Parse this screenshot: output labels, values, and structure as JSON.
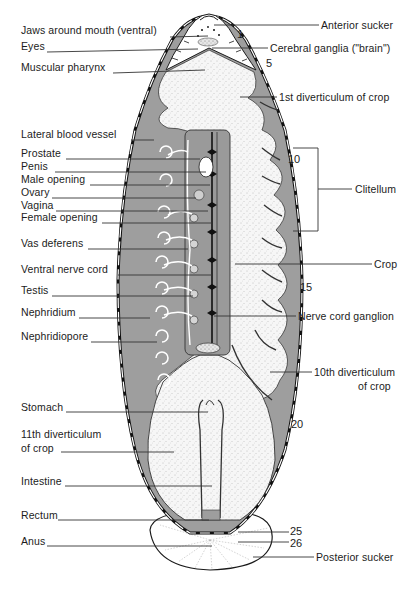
{
  "figure": {
    "colors": {
      "ink": "#1a1a1a",
      "gray_tissue": "#9a9a9a",
      "stipple_light": "#f2f2f2",
      "background": "#ffffff"
    }
  },
  "labels_left": [
    {
      "text": "Jaws around mouth (ventral)",
      "x": 21,
      "y": 30
    },
    {
      "text": "Eyes",
      "x": 21,
      "y": 46
    },
    {
      "text": "Muscular  pharynx",
      "x": 21,
      "y": 67
    },
    {
      "text": "Lateral  blood  vessel",
      "x": 21,
      "y": 134
    },
    {
      "text": "Prostate",
      "x": 21,
      "y": 153
    },
    {
      "text": "Penis",
      "x": 21,
      "y": 166
    },
    {
      "text": "Male opening",
      "x": 21,
      "y": 179
    },
    {
      "text": "Ovary",
      "x": 21,
      "y": 192
    },
    {
      "text": "Vagina",
      "x": 21,
      "y": 205
    },
    {
      "text": "Female opening",
      "x": 21,
      "y": 217
    },
    {
      "text": "Vas deferens",
      "x": 21,
      "y": 243
    },
    {
      "text": "Ventral  nerve  cord",
      "x": 21,
      "y": 269
    },
    {
      "text": "Testis",
      "x": 21,
      "y": 290
    },
    {
      "text": "Nephridium",
      "x": 21,
      "y": 312
    },
    {
      "text": "Nephridiopore",
      "x": 21,
      "y": 336
    },
    {
      "text": "Stomach",
      "x": 21,
      "y": 407
    },
    {
      "text": "11th  diverticulum",
      "x": 21,
      "y": 434
    },
    {
      "text": "of crop",
      "x": 21,
      "y": 448
    },
    {
      "text": "Intestine",
      "x": 21,
      "y": 481
    },
    {
      "text": "Rectum",
      "x": 21,
      "y": 515
    },
    {
      "text": "Anus",
      "x": 21,
      "y": 541
    }
  ],
  "labels_right": [
    {
      "text": "Anterior  sucker",
      "x": 321,
      "y": 19
    },
    {
      "text": "Cerebral  ganglia (\"brain\")",
      "x": 270,
      "y": 42
    },
    {
      "text": "1st diverticulum of  crop",
      "x": 279,
      "y": 92
    },
    {
      "text": "Clitellum",
      "x": 355,
      "y": 183
    },
    {
      "text": "Crop",
      "x": 374,
      "y": 258
    },
    {
      "text": "Nerve  cord  ganglion",
      "x": 298,
      "y": 311
    },
    {
      "text": "10th diverticulum",
      "x": 314,
      "y": 365
    },
    {
      "text": "of  crop",
      "x": 358,
      "y": 380
    },
    {
      "text": "Posterior  sucker",
      "x": 316,
      "y": 551
    }
  ],
  "segment_numbers": [
    {
      "text": "1",
      "x": 237,
      "y": 28
    },
    {
      "text": "5",
      "x": 266,
      "y": 58
    },
    {
      "text": "10",
      "x": 288,
      "y": 153
    },
    {
      "text": "15",
      "x": 300,
      "y": 281
    },
    {
      "text": "20",
      "x": 291,
      "y": 418
    },
    {
      "text": "25",
      "x": 290,
      "y": 525
    },
    {
      "text": "26",
      "x": 290,
      "y": 537
    }
  ]
}
